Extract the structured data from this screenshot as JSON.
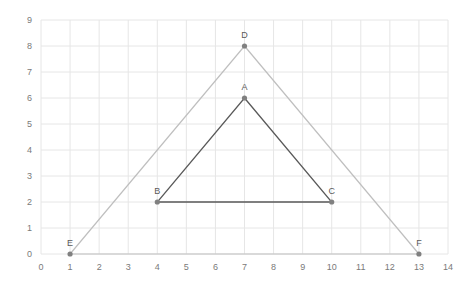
{
  "chart_data": {
    "type": "scatter",
    "title": "",
    "xlabel": "",
    "ylabel": "",
    "xlim": [
      0,
      14
    ],
    "ylim": [
      0,
      9
    ],
    "xticks": [
      0,
      1,
      2,
      3,
      4,
      5,
      6,
      7,
      8,
      9,
      10,
      11,
      12,
      13,
      14
    ],
    "yticks": [
      0,
      1,
      2,
      3,
      4,
      5,
      6,
      7,
      8,
      9
    ],
    "grid": true,
    "legend": null,
    "series": [
      {
        "name": "Outer triangle",
        "color": "#bfbfbf",
        "closed": true,
        "points": [
          {
            "label": "D",
            "x": 7,
            "y": 8
          },
          {
            "label": "F",
            "x": 13,
            "y": 0
          },
          {
            "label": "E",
            "x": 1,
            "y": 0
          }
        ]
      },
      {
        "name": "Inner triangle",
        "color": "#595959",
        "closed": true,
        "points": [
          {
            "label": "A",
            "x": 7,
            "y": 6
          },
          {
            "label": "C",
            "x": 10,
            "y": 2
          },
          {
            "label": "B",
            "x": 4,
            "y": 2
          }
        ]
      }
    ],
    "colors": {
      "grid": "#e6e6e6",
      "marker": "#808080",
      "tick_text": "#7a7a7a",
      "point_label": "#595959"
    }
  }
}
